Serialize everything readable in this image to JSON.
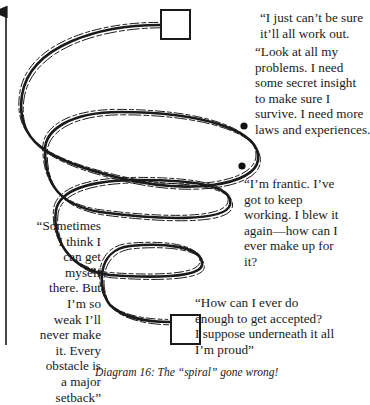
{
  "diagram": {
    "caption": "Diagram 16: The “spiral” gone wrong!",
    "axis": {
      "direction": "up",
      "label": ""
    },
    "nodes": [
      {
        "id": "top-box",
        "shape": "square"
      },
      {
        "id": "bottom-box",
        "shape": "square"
      },
      {
        "id": "dot-upper",
        "shape": "dot"
      },
      {
        "id": "dot-lower",
        "shape": "dot"
      }
    ],
    "quotes": {
      "top": "“I just can’t be sure\nit’ll all work out.",
      "look": "“Look at all my\nproblems. I need\nsome secret insight\nto make sure I\nsurvive. I need more\nlaws and experiences.",
      "frantic": "“I’m frantic. I’ve\ngot to keep\nworking. I blew it\nagain—how can I\never make up for\nit?",
      "sometimes": "“Sometimes\nI think I\ncan get\nmyself\nthere. But\nI’m so\nweak I’ll\nnever make\nit. Every\nobstacle is\na major\nsetback”",
      "how": "“How can I ever do\nenough to get accepted?\nI suppose underneath it all\nI’m proud”"
    },
    "colors": {
      "ink": "#1a1a1a",
      "background": "#ffffff"
    }
  }
}
